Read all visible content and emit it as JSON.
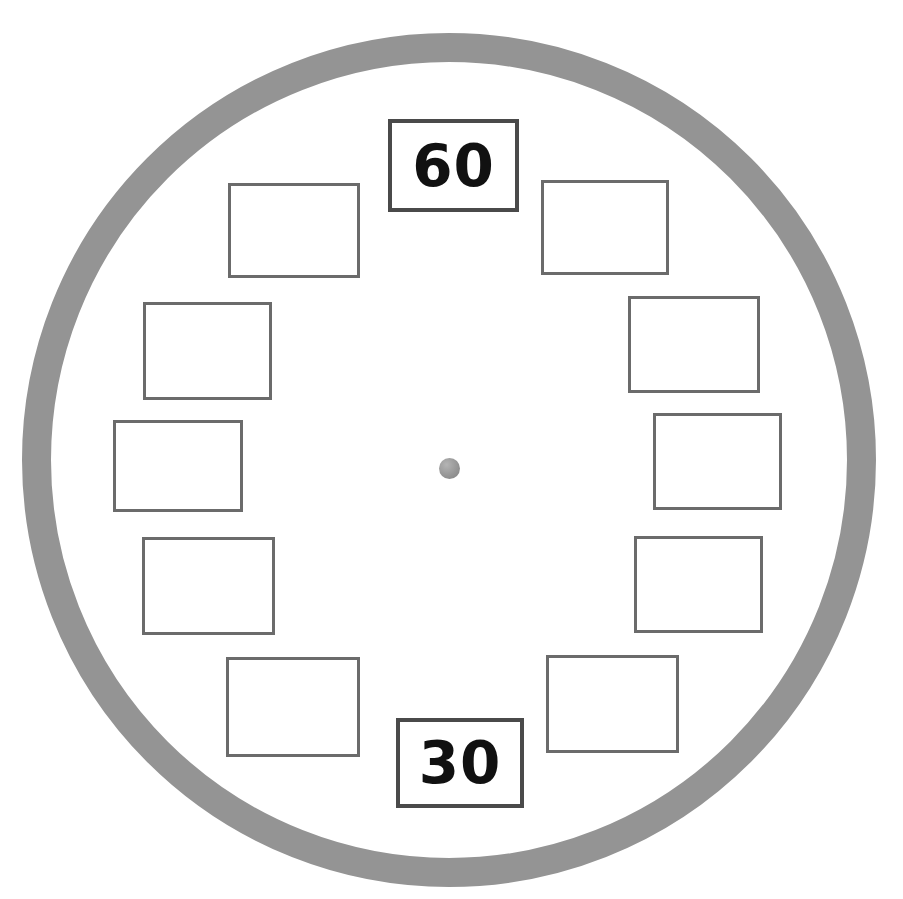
{
  "diagram": {
    "bezel": {
      "name": "clock-bezel-ring",
      "color": "#949494",
      "center_x": 449,
      "center_y": 460,
      "outer_radius": 427,
      "ring_thickness": 29
    },
    "center_dot": {
      "name": "clock-center-pivot",
      "color": "#9a9a9a",
      "diameter": 21
    },
    "box_style": {
      "empty_border_color": "#6b6b6b",
      "filled_border_color": "#4a4a4a",
      "fill_color": "#ffffff"
    },
    "boxes": [
      {
        "position": "12-oclock",
        "hour": 12,
        "label": "60",
        "filled": true,
        "x": 388,
        "y": 119,
        "w": 131,
        "h": 93
      },
      {
        "position": "1-oclock",
        "hour": 1,
        "label": "",
        "filled": false,
        "x": 541,
        "y": 180,
        "w": 128,
        "h": 95
      },
      {
        "position": "2-oclock",
        "hour": 2,
        "label": "",
        "filled": false,
        "x": 628,
        "y": 296,
        "w": 132,
        "h": 97
      },
      {
        "position": "3-oclock",
        "hour": 3,
        "label": "",
        "filled": false,
        "x": 653,
        "y": 413,
        "w": 129,
        "h": 97
      },
      {
        "position": "4-oclock",
        "hour": 4,
        "label": "",
        "filled": false,
        "x": 634,
        "y": 536,
        "w": 129,
        "h": 97
      },
      {
        "position": "5-oclock",
        "hour": 5,
        "label": "",
        "filled": false,
        "x": 546,
        "y": 655,
        "w": 133,
        "h": 98
      },
      {
        "position": "6-oclock",
        "hour": 6,
        "label": "30",
        "filled": true,
        "x": 396,
        "y": 718,
        "w": 128,
        "h": 90
      },
      {
        "position": "7-oclock",
        "hour": 7,
        "label": "",
        "filled": false,
        "x": 226,
        "y": 657,
        "w": 134,
        "h": 100
      },
      {
        "position": "8-oclock",
        "hour": 8,
        "label": "",
        "filled": false,
        "x": 142,
        "y": 537,
        "w": 133,
        "h": 98
      },
      {
        "position": "9-oclock",
        "hour": 9,
        "label": "",
        "filled": false,
        "x": 113,
        "y": 420,
        "w": 130,
        "h": 92
      },
      {
        "position": "10-oclock",
        "hour": 10,
        "label": "",
        "filled": false,
        "x": 143,
        "y": 302,
        "w": 129,
        "h": 98
      },
      {
        "position": "11-oclock",
        "hour": 11,
        "label": "",
        "filled": false,
        "x": 228,
        "y": 183,
        "w": 132,
        "h": 95
      }
    ]
  }
}
